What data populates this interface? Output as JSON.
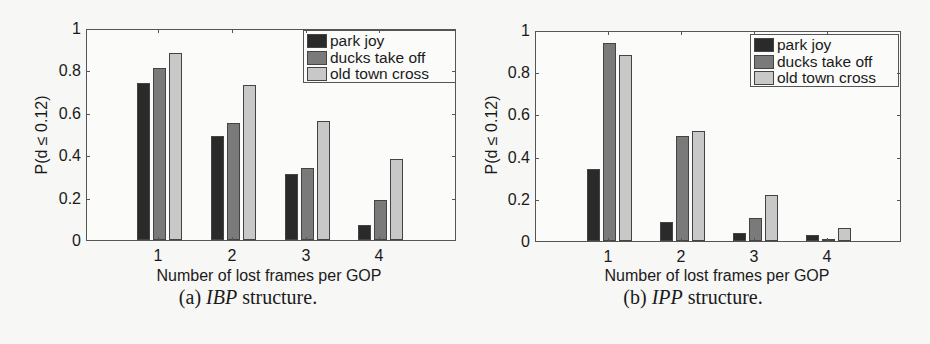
{
  "colors": {
    "park joy": "#2a2a2a",
    "ducks take off": "#7a7a7a",
    "old town cross": "#c8c8c8"
  },
  "chart_data": [
    {
      "type": "bar",
      "title": "",
      "caption_prefix": "(a)",
      "caption_italic": "IBP",
      "caption_suffix": "structure.",
      "xlabel": "Number of lost frames per GOP",
      "ylabel": "P(d ≤ 0.12)",
      "categories": [
        "1",
        "2",
        "3",
        "4"
      ],
      "yticks": [
        "0",
        "0.2",
        "0.4",
        "0.6",
        "0.8",
        "1"
      ],
      "ylim": [
        0,
        1
      ],
      "grid": false,
      "legend_position": "upper right",
      "series": [
        {
          "name": "park joy",
          "values": [
            0.74,
            0.49,
            0.31,
            0.07
          ]
        },
        {
          "name": "ducks take off",
          "values": [
            0.81,
            0.55,
            0.34,
            0.19
          ]
        },
        {
          "name": "old town cross",
          "values": [
            0.88,
            0.73,
            0.56,
            0.38
          ]
        }
      ]
    },
    {
      "type": "bar",
      "title": "",
      "caption_prefix": "(b)",
      "caption_italic": "IPP",
      "caption_suffix": "structure.",
      "xlabel": "Number of lost frames per GOP",
      "ylabel": "P(d ≤ 0.12)",
      "categories": [
        "1",
        "2",
        "3",
        "4"
      ],
      "yticks": [
        "0",
        "0.2",
        "0.4",
        "0.6",
        "0.8",
        "1"
      ],
      "ylim": [
        0,
        1
      ],
      "grid": false,
      "legend_position": "upper right",
      "series": [
        {
          "name": "park joy",
          "values": [
            0.34,
            0.09,
            0.04,
            0.03
          ]
        },
        {
          "name": "ducks take off",
          "values": [
            0.94,
            0.5,
            0.11,
            0.01
          ]
        },
        {
          "name": "old town cross",
          "values": [
            0.88,
            0.52,
            0.22,
            0.06
          ]
        }
      ]
    }
  ]
}
